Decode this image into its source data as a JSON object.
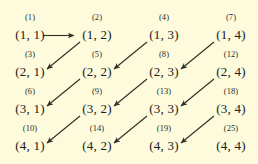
{
  "figure": {
    "name": "cantor-pairing-enumeration",
    "background_color": "#fdfbdc",
    "text_color": "#20201c",
    "arrow_color": "#2f2f28",
    "columns": 4,
    "rows": 4
  },
  "grid": {
    "rows": [
      {
        "cells": [
          {
            "index": "(1)",
            "pair": "(1, 1)"
          },
          {
            "index": "(2)",
            "pair": "(1, 2)"
          },
          {
            "index": "(4)",
            "pair": "(1, 3)"
          },
          {
            "index": "(7)",
            "pair": "(1, 4)"
          }
        ]
      },
      {
        "cells": [
          {
            "index": "(3)",
            "pair": "(2, 1)"
          },
          {
            "index": "(5)",
            "pair": "(2, 2)"
          },
          {
            "index": "(8)",
            "pair": "(2, 3)"
          },
          {
            "index": "(12)",
            "pair": "(2, 4)"
          }
        ]
      },
      {
        "cells": [
          {
            "index": "(6)",
            "pair": "(3, 1)"
          },
          {
            "index": "(9)",
            "pair": "(3, 2)"
          },
          {
            "index": "(13)",
            "pair": "(3, 3)"
          },
          {
            "index": "(18)",
            "pair": "(3, 4)"
          }
        ]
      },
      {
        "cells": [
          {
            "index": "(10)",
            "pair": "(4, 1)"
          },
          {
            "index": "(14)",
            "pair": "(4, 2)"
          },
          {
            "index": "(19)",
            "pair": "(4, 3)"
          },
          {
            "index": "(25)",
            "pair": "(4, 4)"
          }
        ]
      }
    ]
  },
  "arrows": [
    {
      "name": "arrow-1-1-to-1-2",
      "kind": "horizontal",
      "from": "(1, 1)",
      "to": "(1, 2)"
    },
    {
      "name": "arrow-1-2-to-2-1",
      "kind": "diagonal",
      "from": "(1, 2)",
      "to": "(2, 1)"
    },
    {
      "name": "arrow-1-3-to-2-2",
      "kind": "diagonal",
      "from": "(1, 3)",
      "to": "(2, 2)"
    },
    {
      "name": "arrow-2-2-to-3-1",
      "kind": "diagonal",
      "from": "(2, 2)",
      "to": "(3, 1)"
    },
    {
      "name": "arrow-1-4-to-2-3",
      "kind": "diagonal",
      "from": "(1, 4)",
      "to": "(2, 3)"
    },
    {
      "name": "arrow-2-3-to-3-2",
      "kind": "diagonal",
      "from": "(2, 3)",
      "to": "(3, 2)"
    },
    {
      "name": "arrow-3-2-to-4-1",
      "kind": "diagonal",
      "from": "(3, 2)",
      "to": "(4, 1)"
    },
    {
      "name": "arrow-2-4-to-3-3",
      "kind": "diagonal",
      "from": "(2, 4)",
      "to": "(3, 3)"
    },
    {
      "name": "arrow-3-3-to-4-2",
      "kind": "diagonal",
      "from": "(3, 3)",
      "to": "(4, 2)"
    },
    {
      "name": "arrow-3-4-to-4-3",
      "kind": "diagonal",
      "from": "(3, 4)",
      "to": "(4, 3)"
    }
  ]
}
